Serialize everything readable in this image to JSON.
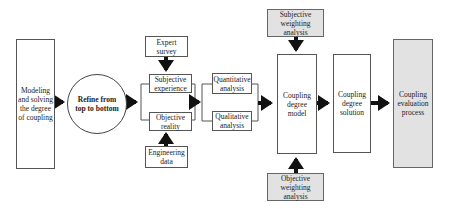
{
  "nodes": {
    "modeling": "Modeling and solving the degree of coupling",
    "refine": "Refine from top to bottom",
    "expert_survey": "Expert survey",
    "subjective_experience": "Subjective experience",
    "objective_reality": "Objective reality",
    "engineering_data": "Engineering data",
    "quantitative": "Quantitative analysis",
    "qualitative": "Qualitative analysis",
    "subjective_weighting": "Subjective weighting analysis",
    "objective_weighting": "Objective weighting analysis",
    "coupling_model": "Coupling degree model",
    "coupling_solution": "Coupling degree solution",
    "coupling_evaluation": "Coupling evaluation process"
  },
  "colors": {
    "grey_box": "#e2e2e2",
    "arrow": "#111111",
    "border": "#555555"
  }
}
